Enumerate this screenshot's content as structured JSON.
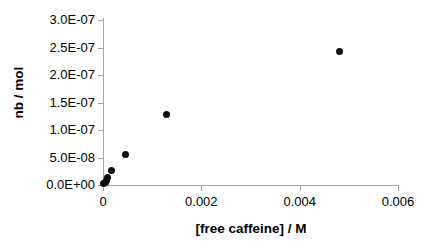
{
  "chart_data": {
    "type": "scatter",
    "title": "",
    "xlabel": "[free caffeine] / M",
    "ylabel": "nb / mol",
    "xlim": [
      0,
      0.006
    ],
    "ylim": [
      0,
      3e-07
    ],
    "grid": false,
    "legend": null,
    "x_ticks": [
      {
        "value": 0,
        "label": "0"
      },
      {
        "value": 0.002,
        "label": "0.002"
      },
      {
        "value": 0.004,
        "label": "0.004"
      },
      {
        "value": 0.006,
        "label": "0.006"
      }
    ],
    "y_ticks": [
      {
        "value": 0,
        "label": "0.0E+00"
      },
      {
        "value": 5e-08,
        "label": "5.0E-08"
      },
      {
        "value": 1e-07,
        "label": "1.0E-07"
      },
      {
        "value": 1.5e-07,
        "label": "1.5E-07"
      },
      {
        "value": 2e-07,
        "label": "2.0E-07"
      },
      {
        "value": 2.5e-07,
        "label": "2.5E-07"
      },
      {
        "value": 3e-07,
        "label": "3.0E-07"
      }
    ],
    "series": [
      {
        "name": "nb vs free caffeine",
        "marker": "filled-circle",
        "color": "#0d0d0d",
        "points": [
          {
            "x": 2e-05,
            "y": 2e-09
          },
          {
            "x": 4.5e-05,
            "y": 5e-09
          },
          {
            "x": 7e-05,
            "y": 9e-09
          },
          {
            "x": 0.0001,
            "y": 1.4e-08
          },
          {
            "x": 0.00018,
            "y": 2.6e-08
          },
          {
            "x": 0.00045,
            "y": 5.5e-08
          },
          {
            "x": 0.0013,
            "y": 1.29e-07
          },
          {
            "x": 0.00482,
            "y": 2.43e-07
          }
        ]
      }
    ]
  }
}
